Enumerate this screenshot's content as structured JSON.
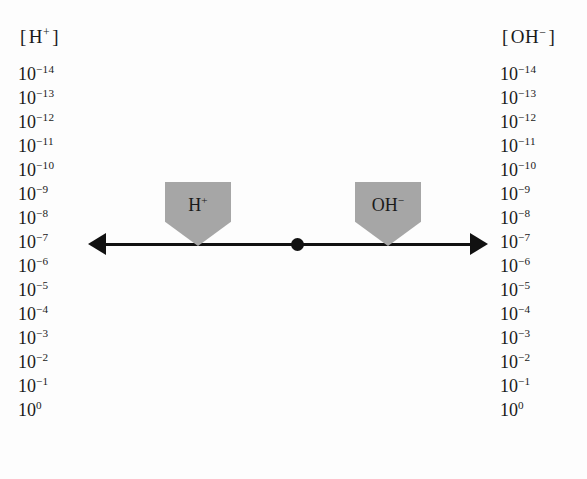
{
  "diagram": {
    "type": "concentration-scale",
    "background_color": "#fdfdfd",
    "ink_color": "#111111",
    "marker_color": "#a6a6a6",
    "left_scale": {
      "header_open_bracket": "[",
      "header_base": "H",
      "header_charge": "+",
      "header_close_bracket": "]",
      "ticks": [
        {
          "base": "10",
          "exponent": "-14"
        },
        {
          "base": "10",
          "exponent": "-13"
        },
        {
          "base": "10",
          "exponent": "-12"
        },
        {
          "base": "10",
          "exponent": "-11"
        },
        {
          "base": "10",
          "exponent": "-10"
        },
        {
          "base": "10",
          "exponent": "-9"
        },
        {
          "base": "10",
          "exponent": "-8"
        },
        {
          "base": "10",
          "exponent": "-7"
        },
        {
          "base": "10",
          "exponent": "-6"
        },
        {
          "base": "10",
          "exponent": "-5"
        },
        {
          "base": "10",
          "exponent": "-4"
        },
        {
          "base": "10",
          "exponent": "-3"
        },
        {
          "base": "10",
          "exponent": "-2"
        },
        {
          "base": "10",
          "exponent": "-1"
        },
        {
          "base": "10",
          "exponent": "0"
        }
      ]
    },
    "right_scale": {
      "header_open_bracket": "[",
      "header_base": "OH",
      "header_charge": "−",
      "header_close_bracket": "]",
      "ticks": [
        {
          "base": "10",
          "exponent": "-14"
        },
        {
          "base": "10",
          "exponent": "-13"
        },
        {
          "base": "10",
          "exponent": "-12"
        },
        {
          "base": "10",
          "exponent": "-11"
        },
        {
          "base": "10",
          "exponent": "-10"
        },
        {
          "base": "10",
          "exponent": "-9"
        },
        {
          "base": "10",
          "exponent": "-8"
        },
        {
          "base": "10",
          "exponent": "-7"
        },
        {
          "base": "10",
          "exponent": "-6"
        },
        {
          "base": "10",
          "exponent": "-5"
        },
        {
          "base": "10",
          "exponent": "-4"
        },
        {
          "base": "10",
          "exponent": "-3"
        },
        {
          "base": "10",
          "exponent": "-2"
        },
        {
          "base": "10",
          "exponent": "-1"
        },
        {
          "base": "10",
          "exponent": "0"
        }
      ]
    },
    "axis": {
      "direction": "double-headed-horizontal",
      "aligned_with_exponent": "-7",
      "center_point_label": ""
    },
    "markers": [
      {
        "id": "h-plus",
        "base": "H",
        "charge": "+"
      },
      {
        "id": "oh-minus",
        "base": "OH",
        "charge": "−"
      }
    ]
  }
}
